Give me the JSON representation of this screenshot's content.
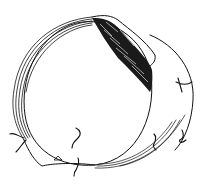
{
  "figure": {
    "colors": {
      "ink": "#111111",
      "paper": "#ffffff"
    },
    "elements": {
      "outer_wall": "striated-wall-icon",
      "dark_mass": "hatched-mass-icon",
      "sutures": [
        "suture-icon",
        "suture-icon",
        "suture-icon",
        "suture-icon",
        "suture-icon",
        "suture-icon"
      ]
    }
  }
}
